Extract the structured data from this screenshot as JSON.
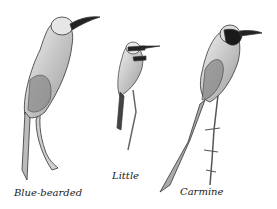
{
  "illustration": {
    "subject": "Bee-eaters sketch",
    "birds": [
      {
        "label": "Blue-bearded"
      },
      {
        "label": "Little"
      },
      {
        "label": "Carmine"
      }
    ]
  }
}
